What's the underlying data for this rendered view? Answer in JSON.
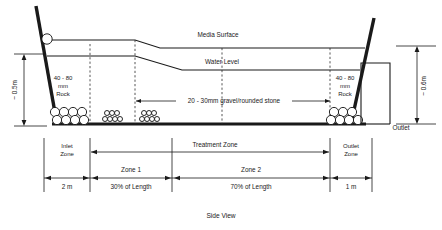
{
  "figure": {
    "caption": "Side View",
    "labels": {
      "media_surface": "Media Surface",
      "water_level": "Water Level",
      "gravel": "20 - 30mm gravel/rounded stone",
      "rock_left_line1": "40 - 80",
      "rock_left_line2": "mm",
      "rock_left_line3": "Rock",
      "rock_right_line1": "40 - 80",
      "rock_right_line2": "mm",
      "rock_right_line3": "Rock",
      "outlet": "Outlet",
      "depth_left": "~ 0.5m",
      "depth_right": "~ 0.6m"
    },
    "zones": {
      "inlet_line1": "Inlet",
      "inlet_line2": "Zone",
      "treatment": "Treatment Zone",
      "outlet_line1": "Outlet",
      "outlet_line2": "Zone",
      "zone1": "Zone 1",
      "zone2": "Zone 2"
    },
    "dimensions": {
      "inlet_length": "2 m",
      "zone1_length": "30% of Length",
      "zone2_length": "70% of Length",
      "outlet_length": "1 m"
    },
    "colors": {
      "ink": "#1a1a1a",
      "line": "#111111",
      "background": "#ffffff"
    }
  }
}
